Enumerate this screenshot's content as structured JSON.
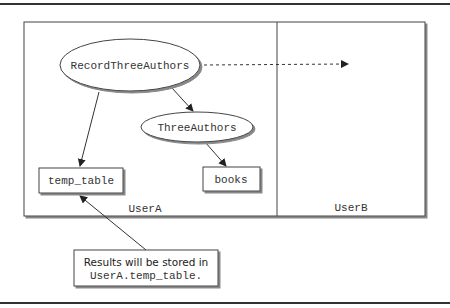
{
  "diagram": {
    "zones": [
      {
        "label": "UserA"
      },
      {
        "label": "UserB"
      }
    ],
    "nodes": {
      "record_three_authors": "RecordThreeAuthors",
      "three_authors": "ThreeAuthors",
      "temp_table": "temp_table",
      "books": "books"
    },
    "callout": {
      "line1": "Results will be stored in",
      "line2": "UserA.temp_table."
    },
    "edges": [
      {
        "from": "RecordThreeAuthors",
        "to": "ThreeAuthors",
        "style": "solid"
      },
      {
        "from": "RecordThreeAuthors",
        "to": "temp_table",
        "style": "solid"
      },
      {
        "from": "ThreeAuthors",
        "to": "books",
        "style": "solid"
      },
      {
        "from": "RecordThreeAuthors",
        "to": "UserB",
        "style": "dashed"
      },
      {
        "from": "callout",
        "to": "temp_table",
        "style": "solid"
      }
    ]
  }
}
